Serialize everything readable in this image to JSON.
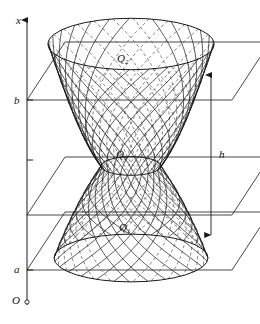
{
  "figure": {
    "type": "geometry-diagram",
    "background": "#ffffff",
    "stroke_color": "#1a1a1a",
    "dashed_color": "#555555"
  },
  "axis": {
    "name": "x-axis",
    "label": "x",
    "origin_label": "O",
    "orientation": "vertical",
    "arrow": "up",
    "x_px": 27,
    "top_px": 20,
    "bottom_px": 305,
    "ticks": [
      {
        "label": "b",
        "y_px": 100
      },
      {
        "label": "",
        "y_px": 160
      },
      {
        "label": "a",
        "y_px": 270
      }
    ]
  },
  "planes": [
    {
      "name": "top-plane",
      "level_label": "b",
      "y_front_px": 100,
      "y_back_px": 42,
      "left_px": 27,
      "right_px": 232,
      "skew_px": 38
    },
    {
      "name": "middle-plane",
      "level_label": "",
      "y_front_px": 215,
      "y_back_px": 157,
      "left_px": 27,
      "right_px": 232,
      "skew_px": 38
    },
    {
      "name": "bottom-plane",
      "level_label": "a",
      "y_front_px": 270,
      "y_back_px": 212,
      "left_px": 27,
      "right_px": 232,
      "skew_px": 38
    }
  ],
  "surface": {
    "name": "hyperboloid-of-one-sheet",
    "kind": "ruled-surface",
    "center_x_px": 131,
    "top_y_px": 44,
    "waist_y_px": 166,
    "bottom_y_px": 258,
    "top_radius_px": 83,
    "waist_radius_px": 30,
    "bottom_radius_px": 77,
    "ellipse_squash": 0.31,
    "ruling_count": 26
  },
  "labels": {
    "q_top": {
      "base": "Q",
      "sub": "2"
    },
    "q_middle": {
      "base": "Q",
      "sub": "0"
    },
    "q_bottom": {
      "base": "Q",
      "sub": "1"
    }
  },
  "dimension": {
    "name": "height-dimension",
    "label": "h",
    "x_px": 211,
    "top_px": 74,
    "bottom_px": 236,
    "arrows": "both"
  }
}
